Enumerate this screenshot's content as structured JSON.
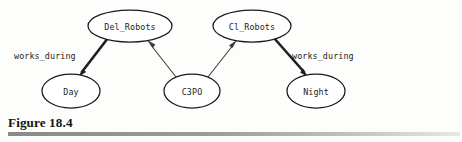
{
  "figure": {
    "caption": "Figure 18.4",
    "background_color": "#fdfdfb",
    "rule_color": "#8c8c8c"
  },
  "diagram": {
    "type": "directed-graph",
    "nodes": [
      {
        "id": "del_robots",
        "label": "Del_Robots",
        "cx": 130,
        "cy": 26,
        "rx": 42,
        "ry": 16
      },
      {
        "id": "cl_robots",
        "label": "Cl_Robots",
        "cx": 252,
        "cy": 26,
        "rx": 39,
        "ry": 16
      },
      {
        "id": "day",
        "label": "Day",
        "cx": 71,
        "cy": 91,
        "rx": 29,
        "ry": 17
      },
      {
        "id": "c3po",
        "label": "C3PO",
        "cx": 192,
        "cy": 91,
        "rx": 28,
        "ry": 17
      },
      {
        "id": "night",
        "label": "Night",
        "cx": 316,
        "cy": 91,
        "rx": 29,
        "ry": 17
      }
    ],
    "edges": [
      {
        "id": "del-robots-to-day",
        "from": "del_robots",
        "to": "day",
        "label": "works_during",
        "weight": "thick"
      },
      {
        "id": "c3po-to-del-robots",
        "from": "c3po",
        "to": "del_robots",
        "label": "",
        "weight": "thin"
      },
      {
        "id": "c3po-to-cl-robots",
        "from": "c3po",
        "to": "cl_robots",
        "label": "",
        "weight": "thin"
      },
      {
        "id": "cl-robots-to-night",
        "from": "cl_robots",
        "to": "night",
        "label": "works_during",
        "weight": "thick"
      }
    ],
    "edge_labels": {
      "left": "works_during",
      "right": "works_during"
    }
  }
}
